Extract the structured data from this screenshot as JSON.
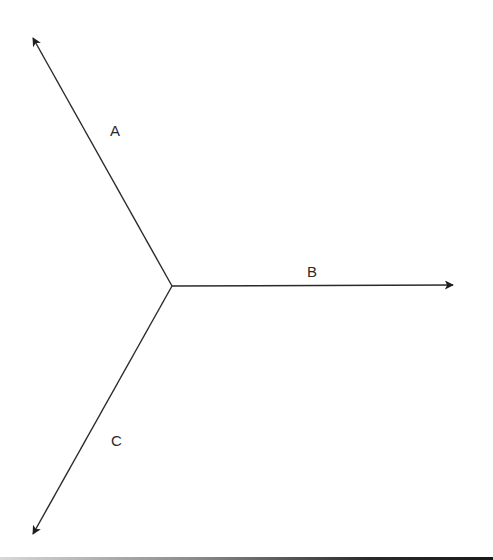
{
  "diagram": {
    "type": "vector-diagram",
    "origin": {
      "x": 172,
      "y": 286
    },
    "stroke_color": "#2a2a2a",
    "vectors": [
      {
        "name": "A",
        "label": "A",
        "tip": {
          "x": 33,
          "y": 38
        },
        "label_pos": {
          "x": 110,
          "y": 136
        }
      },
      {
        "name": "B",
        "label": "B",
        "tip": {
          "x": 453,
          "y": 285
        },
        "label_pos": {
          "x": 307,
          "y": 277
        }
      },
      {
        "name": "C",
        "label": "C",
        "tip": {
          "x": 33,
          "y": 534
        },
        "label_pos": {
          "x": 111,
          "y": 446
        }
      }
    ]
  }
}
